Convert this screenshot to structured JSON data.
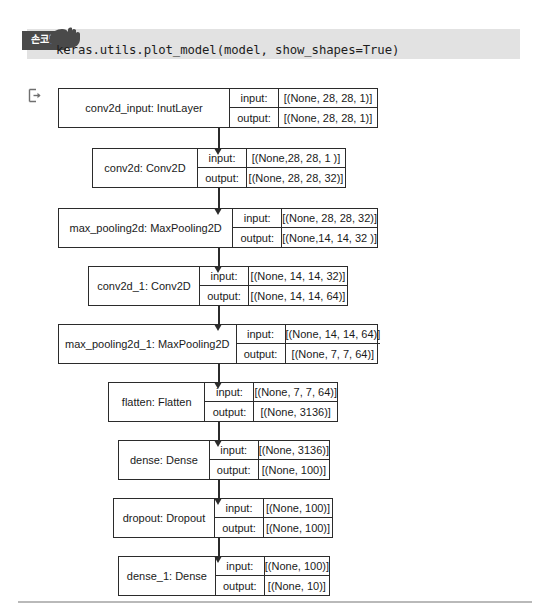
{
  "code_cell": {
    "badge_label": "손코딩",
    "badge_icon": "pointing-hand-icon",
    "code": "keras.utils.plot_model(model, show_shapes=True)"
  },
  "output_cell": {
    "icon": "output-export-icon"
  },
  "diagram": {
    "type": "keras-model-plot",
    "io_labels": {
      "input": "input:",
      "output": "output:"
    },
    "nodes": [
      {
        "name": "conv2d_input: InutLayer",
        "input": "[(None, 28, 28, 1)]",
        "output": "[(None, 28, 28, 1)]",
        "left": 58,
        "top": 88,
        "width": 320,
        "height": 40,
        "name_width": 170
      },
      {
        "name": "conv2d: Conv2D",
        "input": "[(None,28, 28, 1 )]",
        "output": "[(None, 28, 28, 32)]",
        "left": 92,
        "top": 148,
        "width": 254,
        "height": 40,
        "name_width": 104
      },
      {
        "name": "max_pooling2d: MaxPooling2D",
        "input": "[(None, 28, 28, 32)]",
        "output": "[(None,14, 14, 32 )]",
        "left": 58,
        "top": 208,
        "width": 320,
        "height": 40,
        "name_width": 175
      },
      {
        "name": "conv2d_1: Conv2D",
        "input": "[(None, 14, 14, 32)]",
        "output": "[(None, 14, 14, 64)]",
        "left": 88,
        "top": 266,
        "width": 260,
        "height": 40,
        "name_width": 110
      },
      {
        "name": "max_pooling2d_1: MaxPooling2D",
        "input": "[(None, 14, 14, 64)]",
        "output": "[(None, 7, 7, 64)]",
        "left": 58,
        "top": 324,
        "width": 320,
        "height": 40,
        "name_width": 190
      },
      {
        "name": "flatten: Flatten",
        "input": "[(None, 7, 7, 64)]",
        "output": "[(None, 3136)]",
        "left": 108,
        "top": 382,
        "width": 230,
        "height": 40,
        "name_width": 96
      },
      {
        "name": "dense: Dense",
        "input": "[(None, 3136)]",
        "output": "[(None, 100)]",
        "left": 118,
        "top": 440,
        "width": 212,
        "height": 40,
        "name_width": 92
      },
      {
        "name": "dropout: Dropout",
        "input": "[(None, 100)]",
        "output": "[(None, 100)]",
        "left": 113,
        "top": 498,
        "width": 220,
        "height": 40,
        "name_width": 100
      },
      {
        "name": "dense_1: Dense",
        "input": "[(None, 100)]",
        "output": "[(None, 10)]",
        "left": 118,
        "top": 556,
        "width": 212,
        "height": 40,
        "name_width": 96
      }
    ],
    "connectors": [
      {
        "x": 218,
        "y": 128,
        "len": 20
      },
      {
        "x": 218,
        "y": 188,
        "len": 20
      },
      {
        "x": 218,
        "y": 248,
        "len": 18
      },
      {
        "x": 218,
        "y": 306,
        "len": 18
      },
      {
        "x": 218,
        "y": 364,
        "len": 18
      },
      {
        "x": 218,
        "y": 422,
        "len": 18
      },
      {
        "x": 218,
        "y": 480,
        "len": 18
      },
      {
        "x": 218,
        "y": 538,
        "len": 18
      }
    ]
  }
}
